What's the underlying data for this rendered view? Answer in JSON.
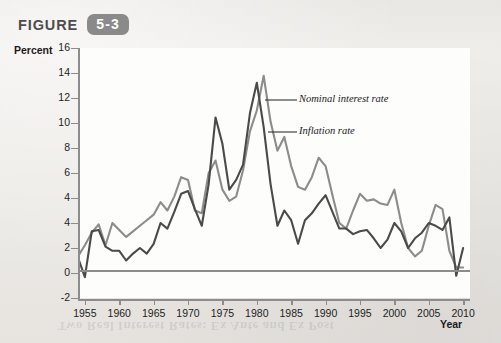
{
  "figure": {
    "word": "FIGURE",
    "number": "5-3"
  },
  "bleed_through_text": "Two Real Interest Rates: Ex Ante and Ex Post",
  "chart_data": {
    "type": "line",
    "title": "",
    "xlabel": "Year",
    "ylabel": "Percent",
    "xlim": [
      1954,
      2011
    ],
    "ylim": [
      -2,
      16
    ],
    "grid": false,
    "legend_position": "inline-annotations",
    "ytick_labels": [
      "16",
      "14",
      "12",
      "10",
      "8",
      "6",
      "4",
      "4",
      "2",
      "0",
      "-2"
    ],
    "ytick_values": [
      16,
      14,
      12,
      10,
      8,
      6,
      4,
      3,
      2,
      0,
      -2
    ],
    "xtick_labels": [
      "1955",
      "1960",
      "1965",
      "1970",
      "1975",
      "1980",
      "1985",
      "1990",
      "1995",
      "2000",
      "2005",
      "2010"
    ],
    "xtick_values": [
      1955,
      1960,
      1965,
      1970,
      1975,
      1980,
      1985,
      1990,
      1995,
      2000,
      2005,
      2010
    ],
    "x": [
      1954,
      1955,
      1956,
      1957,
      1958,
      1959,
      1960,
      1961,
      1962,
      1963,
      1964,
      1965,
      1966,
      1967,
      1968,
      1969,
      1970,
      1971,
      1972,
      1973,
      1974,
      1975,
      1976,
      1977,
      1978,
      1979,
      1980,
      1981,
      1982,
      1983,
      1984,
      1985,
      1986,
      1987,
      1988,
      1989,
      1990,
      1991,
      1992,
      1993,
      1994,
      1995,
      1996,
      1997,
      1998,
      1999,
      2000,
      2001,
      2002,
      2003,
      2004,
      2005,
      2006,
      2007,
      2008,
      2009,
      2010
    ],
    "series": [
      {
        "name": "Nominal interest rate",
        "color": "#8c8c8c",
        "values": [
          1.0,
          1.8,
          2.7,
          3.3,
          1.8,
          3.4,
          2.9,
          2.4,
          2.8,
          3.2,
          3.6,
          4.0,
          4.9,
          4.3,
          5.3,
          6.7,
          6.5,
          4.3,
          4.1,
          7.0,
          7.9,
          5.8,
          5.0,
          5.3,
          7.2,
          10.0,
          11.5,
          14.0,
          10.7,
          8.6,
          9.6,
          7.5,
          6.0,
          5.8,
          6.7,
          8.1,
          7.5,
          5.4,
          3.4,
          3.0,
          4.3,
          5.5,
          5.0,
          5.1,
          4.8,
          4.7,
          5.8,
          3.4,
          1.6,
          1.0,
          1.4,
          3.2,
          4.7,
          4.4,
          1.4,
          0.2,
          0.2
        ]
      },
      {
        "name": "Inflation rate",
        "color": "#4a4a4a",
        "values": [
          0.9,
          -0.5,
          2.8,
          2.9,
          1.7,
          1.4,
          1.4,
          0.7,
          1.2,
          1.6,
          1.2,
          1.9,
          3.4,
          3.0,
          4.2,
          5.5,
          5.7,
          4.4,
          3.2,
          6.2,
          11.0,
          9.1,
          5.8,
          6.5,
          7.6,
          11.3,
          13.5,
          10.3,
          6.2,
          3.2,
          4.3,
          3.6,
          1.9,
          3.6,
          4.1,
          4.8,
          5.4,
          4.2,
          3.0,
          3.0,
          2.6,
          2.8,
          2.9,
          2.3,
          1.6,
          2.2,
          3.4,
          2.8,
          1.6,
          2.3,
          2.7,
          3.4,
          3.2,
          2.9,
          3.8,
          -0.4,
          1.6
        ]
      }
    ],
    "annotations": [
      {
        "label": "Nominal interest rate",
        "target_x": 1981,
        "target_y": 12.0
      },
      {
        "label": "Inflation rate",
        "target_x": 1981,
        "target_y": 9.0
      }
    ]
  }
}
